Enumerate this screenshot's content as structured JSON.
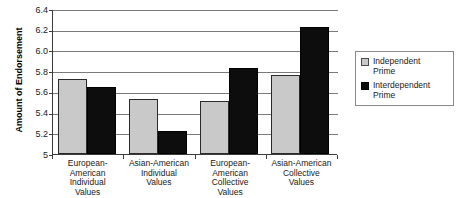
{
  "chart_data": {
    "type": "bar",
    "title": "",
    "xlabel": "",
    "ylabel": "Amount of Endorsement",
    "ylim": [
      5,
      6.4
    ],
    "ytick_labels": [
      "6.4",
      "6.2",
      "6.0",
      "5.8",
      "5.6",
      "5.4",
      "5.2",
      "5"
    ],
    "ytick_values": [
      6.4,
      6.2,
      6.0,
      5.8,
      5.6,
      5.4,
      5.2,
      5.0
    ],
    "grid": "horizontal",
    "legend_position": "right",
    "categories": [
      "European-American Individual Values",
      "Asian-American Individual Values",
      "European-American Collective Values",
      "Asian-American Collective Values"
    ],
    "category_lines": [
      [
        "European-",
        "American",
        "Individual",
        "Values"
      ],
      [
        "Asian-American",
        "Individual",
        "Values"
      ],
      [
        "European-",
        "American",
        "Collective",
        "Values"
      ],
      [
        "Asian-American",
        "Collective",
        "Values"
      ]
    ],
    "series": [
      {
        "name": "Independent Prime",
        "color": "#c9c9c9",
        "values": [
          5.72,
          5.53,
          5.51,
          5.76
        ]
      },
      {
        "name": "Interdependent Prime",
        "color": "#0d0d0d",
        "values": [
          5.65,
          5.22,
          5.83,
          6.23
        ]
      }
    ]
  },
  "legend": {
    "items": [
      {
        "label_line1": "Independent",
        "label_line2": "Prime",
        "swatch": "gray-square-swatch"
      },
      {
        "label_line1": "Interdependent",
        "label_line2": "Prime",
        "swatch": "black-square-swatch"
      }
    ]
  }
}
